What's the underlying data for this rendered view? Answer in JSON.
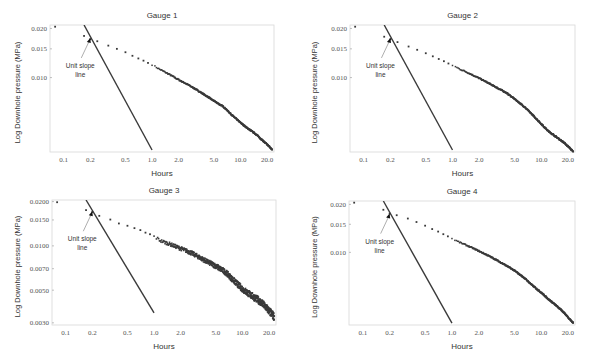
{
  "chart_data": [
    {
      "type": "scatter",
      "title": "Gauge 1",
      "xlabel": "Hours",
      "ylabel": "Log Downhole pressure (MPa)",
      "xscale": "log",
      "yscale": "log",
      "x_ticks": [
        "0.1",
        "0.2",
        "0.5",
        "1.0",
        "2.0",
        "5.0",
        "10.0",
        "20.0"
      ],
      "y_ticks": [
        "0.020",
        "0.015",
        "0.010"
      ],
      "xlim": [
        0.07,
        24
      ],
      "ylim": [
        0.0035,
        0.021
      ],
      "grid": false,
      "annotation": {
        "text_line1": "Unit  slope",
        "text_line2": "line",
        "points_to": [
          0.2,
          0.0175
        ]
      },
      "unit_slope_line": {
        "x": [
          0.17,
          1.0
        ],
        "y": [
          0.021,
          0.0036
        ]
      },
      "series": [
        {
          "name": "Gauge 1 data",
          "x": [
            0.08,
            0.17,
            0.2,
            0.24,
            0.32,
            0.4,
            0.5,
            0.6,
            0.7,
            0.8,
            0.9,
            1.0,
            1.2,
            1.5,
            2.0,
            2.5,
            3.0,
            4.0,
            5.0,
            6.5,
            8.0,
            10.0,
            12.0,
            15.0,
            18.0,
            21.0,
            23.0
          ],
          "y": [
            0.0205,
            0.018,
            0.0172,
            0.0167,
            0.0157,
            0.015,
            0.0143,
            0.0136,
            0.0131,
            0.0127,
            0.0123,
            0.012,
            0.0113,
            0.0106,
            0.0097,
            0.0091,
            0.0086,
            0.0078,
            0.0072,
            0.0066,
            0.0059,
            0.0053,
            0.0049,
            0.0045,
            0.0041,
            0.0038,
            0.0036
          ]
        }
      ]
    },
    {
      "type": "scatter",
      "title": "Gauge 2",
      "xlabel": "Hours",
      "ylabel": "Log Downhole pressure (MPa)",
      "xscale": "log",
      "yscale": "log",
      "x_ticks": [
        "0.1",
        "0.2",
        "0.5",
        "1.0",
        "2.0",
        "5.0",
        "10.0",
        "20.0"
      ],
      "y_ticks": [
        "0.020",
        "0.015",
        "0.010"
      ],
      "xlim": [
        0.07,
        24
      ],
      "ylim": [
        0.0035,
        0.021
      ],
      "grid": false,
      "annotation": {
        "text_line1": "Unit  slope",
        "text_line2": "line",
        "points_to": [
          0.2,
          0.0175
        ]
      },
      "unit_slope_line": {
        "x": [
          0.17,
          1.0
        ],
        "y": [
          0.021,
          0.0036
        ]
      },
      "series": [
        {
          "name": "Gauge 2 data",
          "x": [
            0.08,
            0.17,
            0.2,
            0.24,
            0.32,
            0.4,
            0.5,
            0.6,
            0.7,
            0.8,
            0.9,
            1.0,
            1.2,
            1.5,
            2.0,
            2.5,
            3.0,
            4.0,
            5.0,
            6.5,
            8.0,
            10.0,
            12.0,
            15.0,
            18.0,
            21.0,
            23.0
          ],
          "y": [
            0.0205,
            0.0178,
            0.0172,
            0.0165,
            0.0155,
            0.0148,
            0.0141,
            0.0135,
            0.013,
            0.0126,
            0.0122,
            0.0119,
            0.0113,
            0.0107,
            0.0099,
            0.0093,
            0.0088,
            0.0081,
            0.0074,
            0.0066,
            0.0059,
            0.0052,
            0.0047,
            0.0043,
            0.004,
            0.0037,
            0.0035
          ]
        }
      ]
    },
    {
      "type": "scatter",
      "title": "Gauge 3",
      "xlabel": "Hours",
      "ylabel": "Log Downhole pressure (MPa)",
      "xscale": "log",
      "yscale": "log",
      "x_ticks": [
        "0.1",
        "0.2",
        "0.5",
        "1.0",
        "2.0",
        "5.0",
        "10.0",
        "20.0"
      ],
      "y_ticks": [
        "0.0200",
        "0.0150",
        "0.0100",
        "0.0070",
        "0.0050",
        "0.0030"
      ],
      "xlim": [
        0.07,
        24
      ],
      "ylim": [
        0.0029,
        0.0205
      ],
      "grid": false,
      "annotation": {
        "text_line1": "Unit  slope",
        "text_line2": "line",
        "points_to": [
          0.2,
          0.0172
        ]
      },
      "unit_slope_line": {
        "x": [
          0.17,
          1.0
        ],
        "y": [
          0.0205,
          0.0035
        ]
      },
      "series": [
        {
          "name": "Gauge 3 data",
          "x": [
            0.08,
            0.17,
            0.2,
            0.24,
            0.32,
            0.4,
            0.5,
            0.6,
            0.7,
            0.8,
            0.9,
            1.0,
            1.2,
            1.5,
            2.0,
            2.5,
            3.0,
            4.0,
            5.0,
            6.5,
            8.0,
            10.0,
            12.0,
            15.0,
            18.0,
            21.0,
            23.0
          ],
          "y": [
            0.0198,
            0.0175,
            0.017,
            0.016,
            0.0151,
            0.0142,
            0.0137,
            0.0132,
            0.0128,
            0.0123,
            0.012,
            0.0116,
            0.0108,
            0.0103,
            0.0096,
            0.0091,
            0.0086,
            0.0078,
            0.0073,
            0.0066,
            0.0058,
            0.0051,
            0.0047,
            0.0043,
            0.0039,
            0.0035,
            0.0033
          ]
        }
      ]
    },
    {
      "type": "scatter",
      "title": "Gauge 4",
      "xlabel": "Hours",
      "ylabel": "Log Downhole pressure (MPa)",
      "xscale": "log",
      "yscale": "log",
      "x_ticks": [
        "0.1",
        "0.2",
        "0.5",
        "1.0",
        "2.0",
        "5.0",
        "10.0",
        "20.0"
      ],
      "y_ticks": [
        "0.020",
        "0.015",
        "0.010"
      ],
      "xlim": [
        0.07,
        24
      ],
      "ylim": [
        0.0035,
        0.021
      ],
      "grid": false,
      "annotation": {
        "text_line1": "Unit  slope",
        "text_line2": "line",
        "points_to": [
          0.2,
          0.0175
        ]
      },
      "unit_slope_line": {
        "x": [
          0.17,
          1.0
        ],
        "y": [
          0.021,
          0.0036
        ]
      },
      "series": [
        {
          "name": "Gauge 4 data",
          "x": [
            0.08,
            0.17,
            0.2,
            0.24,
            0.32,
            0.4,
            0.5,
            0.6,
            0.7,
            0.8,
            0.9,
            1.0,
            1.2,
            1.5,
            2.0,
            2.5,
            3.0,
            4.0,
            5.0,
            6.5,
            8.0,
            10.0,
            12.0,
            15.0,
            18.0,
            21.0,
            23.0
          ],
          "y": [
            0.0205,
            0.0185,
            0.0175,
            0.0171,
            0.0163,
            0.0155,
            0.0147,
            0.014,
            0.0135,
            0.013,
            0.0126,
            0.0122,
            0.0116,
            0.011,
            0.0102,
            0.0096,
            0.0091,
            0.0083,
            0.0077,
            0.0069,
            0.0062,
            0.0056,
            0.0051,
            0.0046,
            0.0042,
            0.0038,
            0.0036
          ]
        }
      ]
    }
  ],
  "style": {
    "marker_color": "#3a3a3a",
    "line_color": "#3a3a3a",
    "frame_color": "#d8d8d8",
    "tick_color": "#555555"
  }
}
